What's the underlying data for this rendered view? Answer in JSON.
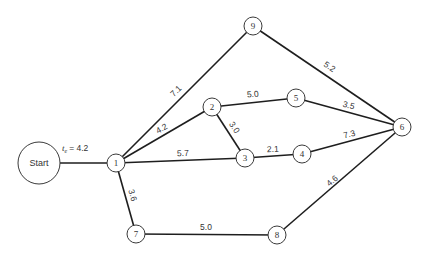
{
  "diagram": {
    "type": "activity-network",
    "start": {
      "id": "start",
      "label": "Start",
      "x": 39,
      "y": 163,
      "r": 21
    },
    "start_edge": {
      "from": "start",
      "to": "1",
      "label_var": "t",
      "label_sub": "e",
      "label_value": "= 4.2"
    },
    "nodes": [
      {
        "id": "1",
        "label": "1",
        "x": 116,
        "y": 163
      },
      {
        "id": "2",
        "label": "2",
        "x": 212,
        "y": 107
      },
      {
        "id": "3",
        "label": "3",
        "x": 245,
        "y": 158
      },
      {
        "id": "4",
        "label": "4",
        "x": 302,
        "y": 154
      },
      {
        "id": "5",
        "label": "5",
        "x": 296,
        "y": 98
      },
      {
        "id": "6",
        "label": "6",
        "x": 402,
        "y": 127
      },
      {
        "id": "7",
        "label": "7",
        "x": 136,
        "y": 234
      },
      {
        "id": "8",
        "label": "8",
        "x": 277,
        "y": 235
      },
      {
        "id": "9",
        "label": "9",
        "x": 253,
        "y": 26
      }
    ],
    "edges": [
      {
        "from": "1",
        "to": "9",
        "weight": "7.1"
      },
      {
        "from": "1",
        "to": "2",
        "weight": "4.2"
      },
      {
        "from": "1",
        "to": "3",
        "weight": "5.7"
      },
      {
        "from": "1",
        "to": "7",
        "weight": "3.6"
      },
      {
        "from": "2",
        "to": "5",
        "weight": "5.0"
      },
      {
        "from": "2",
        "to": "3",
        "weight": "3.0"
      },
      {
        "from": "3",
        "to": "4",
        "weight": "2.1"
      },
      {
        "from": "4",
        "to": "6",
        "weight": "7.3"
      },
      {
        "from": "5",
        "to": "6",
        "weight": "3.5"
      },
      {
        "from": "9",
        "to": "6",
        "weight": "5.2"
      },
      {
        "from": "7",
        "to": "8",
        "weight": "5.0"
      },
      {
        "from": "8",
        "to": "6",
        "weight": "4.6"
      }
    ],
    "node_radius": 9
  }
}
